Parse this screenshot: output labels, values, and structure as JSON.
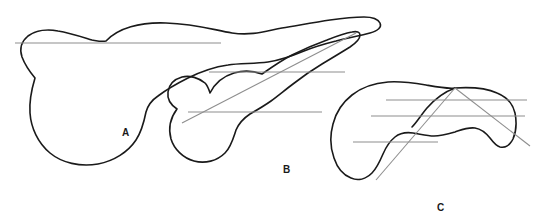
{
  "figure": {
    "type": "line-drawing",
    "background_color": "#ffffff",
    "outline_color": "#1a1a1a",
    "measurement_line_color": "#8e8e8e",
    "label_color": "#1a1a1a",
    "panels": [
      {
        "id": "A",
        "label": "A",
        "label_x": 125,
        "label_y": 134,
        "outline_path": "M 106 41 C 118 28, 140 22, 166 23 C 196 24, 214 30, 232 33 C 252 36, 266 31, 282 28 C 300 25, 316 22, 330 20 C 344 18, 356 17, 364 17 C 372 17, 378 19, 380 23 C 382 27, 378 31, 370 33 C 360 36, 346 38, 336 41 C 324 44, 314 47, 304 51 C 292 56, 282 60, 268 62 C 254 64, 240 63, 228 65 C 214 67, 200 72, 188 78 C 176 84, 166 90, 158 96 C 152 100, 148 105, 146 112 C 144 122, 142 131, 136 140 C 128 152, 114 161, 98 164 C 80 167, 62 163, 50 153 C 38 143, 31 128, 30 113 C 29 100, 32 88, 35 78 C 30 72, 25 65, 22 57 C 19 48, 22 41, 28 36 C 36 30, 48 29, 58 31 C 70 33, 82 37, 92 40 C 98 41, 102 42, 106 41 Z",
        "measurement_lines": [
          {
            "x1": 15,
            "y1": 43,
            "x2": 221,
            "y2": 43,
            "orientation": "horizontal"
          }
        ],
        "axis_lines": []
      },
      {
        "id": "B",
        "label": "B",
        "label_x": 286,
        "label_y": 171,
        "outline_path": "M 210 93 C 215 83, 224 76, 234 73 C 244 70, 254 71, 262 74 C 272 67, 282 60, 292 55 C 304 49, 316 44, 327 40 C 337 36, 346 33, 352 32 C 357 31, 360 32, 360 35 C 360 39, 356 43, 350 47 C 342 52, 332 58, 322 64 C 312 70, 302 77, 293 84 C 285 90, 278 96, 271 101 C 264 106, 257 110, 250 114 C 244 118, 239 123, 236 130 C 233 139, 231 147, 225 153 C 217 161, 205 164, 194 161 C 183 158, 174 149, 171 139 C 168 128, 171 117, 177 109 C 171 105, 167 99, 168 92 C 169 84, 175 79, 182 77 C 190 75, 199 78, 205 83 C 208 86, 209 90, 210 93 Z",
        "measurement_lines": [
          {
            "x1": 209,
            "y1": 72,
            "x2": 345,
            "y2": 72,
            "orientation": "horizontal"
          },
          {
            "x1": 188,
            "y1": 112,
            "x2": 322,
            "y2": 112,
            "orientation": "horizontal"
          }
        ],
        "axis_lines": [
          {
            "x1": 182,
            "y1": 123,
            "x2": 356,
            "y2": 33,
            "orientation": "diagonal"
          }
        ]
      },
      {
        "id": "C",
        "label": "C",
        "label_x": 440,
        "label_y": 209,
        "outline_path": "M 455 88 C 470 87, 486 88, 497 93 C 507 97, 513 104, 515 113 C 517 123, 516 132, 513 139 C 510 145, 505 148, 500 147 C 496 146, 493 142, 490 138 C 486 133, 481 129, 475 128 C 468 127, 461 130, 455 132 C 448 134, 441 136, 434 136 C 427 136, 420 134, 413 133 C 406 132, 400 133, 395 137 C 390 141, 386 147, 383 154 C 380 161, 377 168, 372 173 C 366 179, 358 181, 351 178 C 343 175, 337 167, 334 158 C 330 147, 330 135, 333 124 C 336 112, 343 102, 352 95 C 362 87, 375 83, 388 82 C 401 81, 414 83, 426 85 C 437 87, 447 89, 455 88 Z",
        "outline_inner_path": "M 455 88 C 444 92, 434 100, 427 108 C 421 115, 417 122, 412 127",
        "measurement_lines": [
          {
            "x1": 386,
            "y1": 100,
            "x2": 527,
            "y2": 100,
            "orientation": "horizontal"
          },
          {
            "x1": 371,
            "y1": 116,
            "x2": 525,
            "y2": 116,
            "orientation": "horizontal"
          },
          {
            "x1": 353,
            "y1": 142,
            "x2": 438,
            "y2": 142,
            "orientation": "horizontal"
          }
        ],
        "axis_lines": [
          {
            "x1": 455,
            "y1": 88,
            "x2": 376,
            "y2": 180,
            "orientation": "diagonal"
          },
          {
            "x1": 455,
            "y1": 88,
            "x2": 530,
            "y2": 146,
            "orientation": "diagonal"
          }
        ]
      }
    ]
  }
}
